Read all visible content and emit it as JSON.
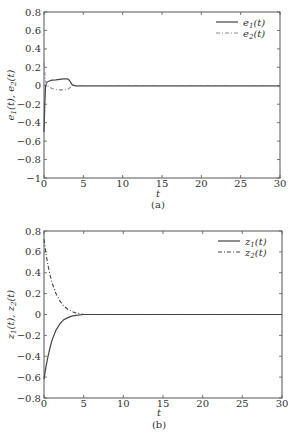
{
  "chart_data": [
    {
      "type": "line",
      "panel": "(a)",
      "caption": "(a)",
      "xlabel": "t",
      "ylabel": "e1(t), e2(t)",
      "xlim": [
        0,
        30
      ],
      "ylim": [
        -1,
        0.8
      ],
      "xticks": [
        0,
        5,
        10,
        15,
        20,
        25,
        30
      ],
      "yticks": [
        0.8,
        0.6,
        0.4,
        0.2,
        0,
        -0.2,
        -0.4,
        -0.6,
        -0.8,
        -1
      ],
      "ytick_labels": [
        "0.8",
        "0.6",
        "0.4",
        "0.2",
        "0",
        "−0.2",
        "−0.4",
        "−0.6",
        "−0.8",
        "−1"
      ],
      "grid": false,
      "legend_position": "upper right",
      "series": [
        {
          "name": "e1(t)",
          "style": "solid",
          "color": "#444444",
          "x": [
            0,
            0.1,
            0.2,
            0.4,
            0.6,
            1.0,
            1.5,
            2.0,
            2.5,
            3.0,
            3.2,
            3.6,
            4.0,
            5,
            10,
            15,
            20,
            25,
            30
          ],
          "y": [
            -0.5,
            -0.2,
            0.0,
            0.04,
            0.05,
            0.06,
            0.065,
            0.07,
            0.075,
            0.075,
            0.06,
            0.01,
            0.0,
            0,
            0,
            0,
            0,
            0,
            0
          ]
        },
        {
          "name": "e2(t)",
          "style": "dashdot",
          "color": "#888888",
          "x": [
            0,
            0.1,
            0.2,
            0.4,
            0.6,
            1.0,
            1.5,
            2.0,
            2.5,
            3.0,
            3.3,
            3.6,
            4.0,
            5,
            10,
            15,
            20,
            25,
            30
          ],
          "y": [
            0.25,
            0.15,
            0.05,
            0.0,
            -0.01,
            -0.03,
            -0.04,
            -0.045,
            -0.045,
            -0.04,
            -0.02,
            0.0,
            0.0,
            0,
            0,
            0,
            0,
            0,
            0
          ]
        }
      ]
    },
    {
      "type": "line",
      "panel": "(b)",
      "caption": "(b)",
      "xlabel": "t",
      "ylabel": "z1(t), z2(t)",
      "xlim": [
        0,
        30
      ],
      "ylim": [
        -0.8,
        0.8
      ],
      "xticks": [
        0,
        5,
        10,
        15,
        20,
        25,
        30
      ],
      "yticks": [
        0.8,
        0.6,
        0.4,
        0.2,
        0,
        -0.2,
        -0.4,
        -0.6,
        -0.8
      ],
      "ytick_labels": [
        "0.8",
        "0.6",
        "0.4",
        "0.2",
        "0",
        "−0.2",
        "−0.4",
        "−0.6",
        "−0.8"
      ],
      "grid": false,
      "legend_position": "upper right",
      "series": [
        {
          "name": "z1(t)",
          "style": "solid",
          "color": "#444444",
          "x": [
            0,
            0.25,
            0.5,
            0.75,
            1.0,
            1.5,
            2.0,
            2.5,
            3.0,
            3.5,
            4.0,
            5,
            10,
            15,
            20,
            25,
            30
          ],
          "y": [
            -0.62,
            -0.5,
            -0.4,
            -0.32,
            -0.25,
            -0.15,
            -0.09,
            -0.05,
            -0.03,
            -0.015,
            -0.008,
            0,
            0,
            0,
            0,
            0,
            0
          ]
        },
        {
          "name": "z2(t)",
          "style": "dashdot",
          "color": "#444444",
          "x": [
            0,
            0.25,
            0.5,
            0.75,
            1.0,
            1.5,
            2.0,
            2.5,
            3.0,
            3.5,
            4.0,
            5,
            10,
            15,
            20,
            25,
            30
          ],
          "y": [
            0.72,
            0.58,
            0.47,
            0.38,
            0.31,
            0.2,
            0.13,
            0.08,
            0.05,
            0.03,
            0.015,
            0,
            0,
            0,
            0,
            0,
            0
          ]
        }
      ]
    }
  ]
}
